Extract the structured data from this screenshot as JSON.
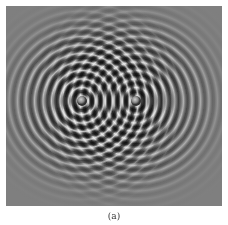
{
  "figure": {
    "caption": "(a)",
    "image_description": "two-source circular wave interference pattern",
    "sources": [
      {
        "name": "left-source",
        "center_px": [
          82,
          101
        ]
      },
      {
        "name": "right-source",
        "center_px": [
          136,
          101
        ]
      }
    ],
    "colors": {
      "background_gray": "#7f7f7f",
      "ring_dark": "#2c2c2c",
      "ring_light": "#d8d8d8",
      "page_background": "#ffffff"
    }
  }
}
